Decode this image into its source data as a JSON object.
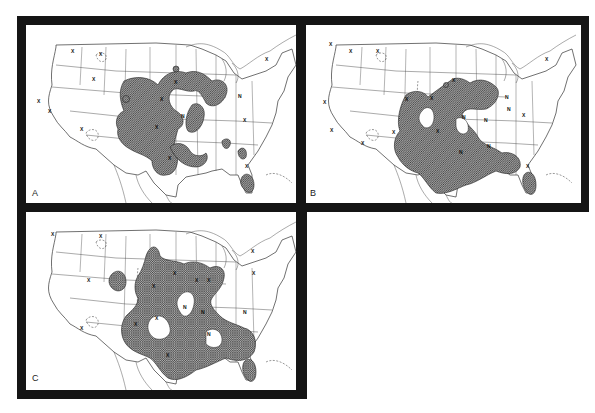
{
  "figure": {
    "panels": [
      {
        "id": "A",
        "label": "A",
        "markers": [
          {
            "t": "X",
            "x": 71,
            "y": 53
          },
          {
            "t": "X",
            "x": 99,
            "y": 56
          },
          {
            "t": "X",
            "x": 92,
            "y": 81
          },
          {
            "t": "X",
            "x": 48,
            "y": 113
          },
          {
            "t": "X",
            "x": 37,
            "y": 103
          },
          {
            "t": "X",
            "x": 80,
            "y": 131
          },
          {
            "t": "X",
            "x": 160,
            "y": 101
          },
          {
            "t": "X",
            "x": 155,
            "y": 129
          },
          {
            "t": "N",
            "x": 181,
            "y": 118
          },
          {
            "t": "N",
            "x": 238,
            "y": 98
          },
          {
            "t": "X",
            "x": 243,
            "y": 122
          },
          {
            "t": "X",
            "x": 265,
            "y": 61
          },
          {
            "t": "X",
            "x": 174,
            "y": 84
          },
          {
            "t": "X",
            "x": 168,
            "y": 160
          },
          {
            "t": "X",
            "x": 245,
            "y": 168
          }
        ],
        "contour_labels": [
          "0.5",
          "0.5",
          "0.5",
          "0.5",
          "2",
          "2",
          "3",
          "1",
          "0.5"
        ]
      },
      {
        "id": "B",
        "label": "B",
        "markers": [
          {
            "t": "X",
            "x": 329,
            "y": 46
          },
          {
            "t": "X",
            "x": 349,
            "y": 53
          },
          {
            "t": "X",
            "x": 376,
            "y": 53
          },
          {
            "t": "X",
            "x": 323,
            "y": 104
          },
          {
            "t": "X",
            "x": 330,
            "y": 132
          },
          {
            "t": "X",
            "x": 361,
            "y": 145
          },
          {
            "t": "X",
            "x": 405,
            "y": 101
          },
          {
            "t": "X",
            "x": 430,
            "y": 100
          },
          {
            "t": "X",
            "x": 392,
            "y": 134
          },
          {
            "t": "X",
            "x": 436,
            "y": 133
          },
          {
            "t": "N",
            "x": 462,
            "y": 119
          },
          {
            "t": "N",
            "x": 484,
            "y": 122
          },
          {
            "t": "N",
            "x": 505,
            "y": 99
          },
          {
            "t": "N",
            "x": 487,
            "y": 148
          },
          {
            "t": "N",
            "x": 459,
            "y": 154
          },
          {
            "t": "N",
            "x": 507,
            "y": 111
          },
          {
            "t": "X",
            "x": 522,
            "y": 117
          },
          {
            "t": "X",
            "x": 545,
            "y": 61
          },
          {
            "t": "X",
            "x": 452,
            "y": 82
          },
          {
            "t": "X",
            "x": 526,
            "y": 168
          }
        ],
        "contour_labels": [
          "0.5",
          "0.5",
          "0.5",
          "0.5",
          "2",
          "1",
          "0.5"
        ]
      },
      {
        "id": "C",
        "label": "C",
        "markers": [
          {
            "t": "X",
            "x": 51,
            "y": 236
          },
          {
            "t": "X",
            "x": 99,
            "y": 238
          },
          {
            "t": "X",
            "x": 87,
            "y": 282
          },
          {
            "t": "X",
            "x": 80,
            "y": 330
          },
          {
            "t": "X",
            "x": 152,
            "y": 288
          },
          {
            "t": "X",
            "x": 173,
            "y": 275
          },
          {
            "t": "X",
            "x": 195,
            "y": 282
          },
          {
            "t": "X",
            "x": 207,
            "y": 282
          },
          {
            "t": "X",
            "x": 134,
            "y": 326
          },
          {
            "t": "X",
            "x": 155,
            "y": 320
          },
          {
            "t": "N",
            "x": 183,
            "y": 309
          },
          {
            "t": "N",
            "x": 201,
            "y": 314
          },
          {
            "t": "N",
            "x": 207,
            "y": 336
          },
          {
            "t": "N",
            "x": 243,
            "y": 314
          },
          {
            "t": "X",
            "x": 166,
            "y": 357
          },
          {
            "t": "X",
            "x": 251,
            "y": 253
          },
          {
            "t": "X",
            "x": 252,
            "y": 275
          }
        ],
        "contour_labels": [
          "0.5",
          "0.5",
          "0.5",
          "0.5",
          "2",
          "1",
          "0.5"
        ]
      }
    ]
  }
}
